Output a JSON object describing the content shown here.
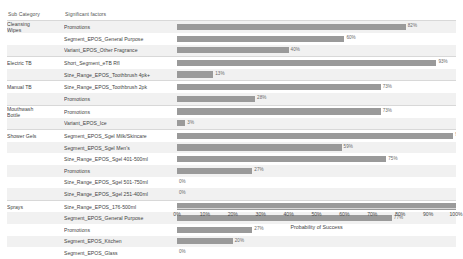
{
  "table": {
    "headers": {
      "sub_category": "Sub Category",
      "significant_factors": "Significant factors"
    }
  },
  "chart_data": {
    "type": "bar",
    "orientation": "horizontal",
    "title": "",
    "xlabel": "Probability of Success",
    "ylabel": "",
    "xlim": [
      0,
      100
    ],
    "xtick_labels": [
      "0%",
      "10%",
      "20%",
      "30%",
      "40%",
      "50%",
      "60%",
      "70%",
      "80%",
      "90%",
      "100%"
    ],
    "xtick_values": [
      0,
      10,
      20,
      30,
      40,
      50,
      60,
      70,
      80,
      90,
      100
    ],
    "grid": false,
    "legend": "none",
    "bar_color": "#9a9a9a",
    "value_unit": "%",
    "groups": [
      {
        "sub_category": "Cleansing Wipes",
        "rows": [
          {
            "factor": "Promotions",
            "value": 82,
            "label": "82%"
          },
          {
            "factor": "Segment_EPOS_General Purpose",
            "value": 60,
            "label": "60%"
          },
          {
            "factor": "Variant_EPOS_Other Fragrance",
            "value": 40,
            "label": "40%"
          }
        ]
      },
      {
        "sub_category": "Electric TB",
        "rows": [
          {
            "factor": "Short_Segment_eTB Rfl",
            "value": 93,
            "label": "93%"
          },
          {
            "factor": "Size_Range_EPOS_Toothbrush 4pk+",
            "value": 13,
            "label": "13%"
          }
        ]
      },
      {
        "sub_category": "Manual TB",
        "rows": [
          {
            "factor": "Size_Range_EPOS_Toothbrush 2pk",
            "value": 73,
            "label": "73%"
          },
          {
            "factor": "Promotions",
            "value": 28,
            "label": "28%"
          }
        ]
      },
      {
        "sub_category": "Mouthwash Bottle",
        "rows": [
          {
            "factor": "Promotions",
            "value": 73,
            "label": "73%"
          },
          {
            "factor": "Variant_EPOS_Ice",
            "value": 3,
            "label": "3%"
          }
        ]
      },
      {
        "sub_category": "Shower Gels",
        "rows": [
          {
            "factor": "Segment_EPOS_Sgel Milk/Skincare",
            "value": 99,
            "label": "99%"
          },
          {
            "factor": "Segment_EPOS_Sgel Men's",
            "value": 59,
            "label": "59%"
          },
          {
            "factor": "Size_Range_EPOS_Sgel 401-500ml",
            "value": 75,
            "label": "75%"
          },
          {
            "factor": "Promotions",
            "value": 27,
            "label": "27%"
          },
          {
            "factor": "Size_Range_EPOS_Sgel 501-750ml",
            "value": 0,
            "label": "0%"
          },
          {
            "factor": "Size_Range_EPOS_Sgel 251-400ml",
            "value": 0,
            "label": "0%"
          }
        ]
      },
      {
        "sub_category": "Sprays",
        "rows": [
          {
            "factor": "Size_Range_EPOS_176-500ml",
            "value": 100,
            "label": "100%"
          },
          {
            "factor": "Segment_EPOS_General Purpose",
            "value": 77,
            "label": "77%"
          },
          {
            "factor": "Promotions",
            "value": 27,
            "label": "27%"
          },
          {
            "factor": "Segment_EPOS_Kitchen",
            "value": 20,
            "label": "20%"
          },
          {
            "factor": "Segment_EPOS_Glass",
            "value": 0,
            "label": "0%"
          }
        ]
      }
    ]
  }
}
